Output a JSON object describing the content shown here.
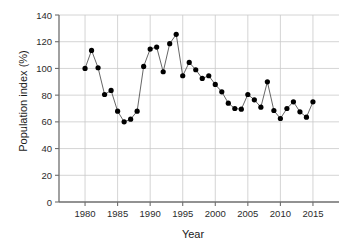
{
  "chart_data": {
    "type": "line",
    "title": "",
    "subtitle": "",
    "xlabel": "Year",
    "ylabel": "Population index (%)",
    "xlim": [
      1976,
      2019
    ],
    "ylim": [
      0,
      140
    ],
    "xticks": [
      1980,
      1985,
      1990,
      1995,
      2000,
      2005,
      2010,
      2015
    ],
    "yticks": [
      0,
      20,
      40,
      60,
      80,
      100,
      120,
      140
    ],
    "grid": true,
    "legend": null,
    "marker": "filled-circle",
    "marker_color": "#000000",
    "line_color": "#555555",
    "x": [
      1980,
      1981,
      1982,
      1983,
      1984,
      1985,
      1986,
      1987,
      1988,
      1989,
      1990,
      1991,
      1992,
      1993,
      1994,
      1995,
      1996,
      1997,
      1998,
      1999,
      2000,
      2001,
      2002,
      2003,
      2004,
      2005,
      2006,
      2007,
      2008,
      2009,
      2010,
      2011,
      2012,
      2013,
      2014,
      2015
    ],
    "values": [
      100,
      113.5,
      100.5,
      80.5,
      83.5,
      68,
      60,
      62,
      68,
      101.5,
      114.5,
      116,
      97.5,
      118.5,
      125.5,
      94.5,
      104.5,
      99,
      92.5,
      94.5,
      88,
      82.5,
      74,
      70,
      69.5,
      80.5,
      76.5,
      71,
      90,
      68.5,
      62.5,
      70,
      75,
      67.5,
      63.5,
      75
    ],
    "series": [
      {
        "name": "Population index",
        "values": [
          100,
          113.5,
          100.5,
          80.5,
          83.5,
          68,
          60,
          62,
          68,
          101.5,
          114.5,
          116,
          97.5,
          118.5,
          125.5,
          94.5,
          104.5,
          99,
          92.5,
          94.5,
          88,
          82.5,
          74,
          70,
          69.5,
          80.5,
          76.5,
          71,
          90,
          68.5,
          62.5,
          70,
          75,
          67.5,
          63.5,
          75
        ]
      }
    ]
  },
  "axes": {
    "y_title": "Population index (%)",
    "x_title": "Year"
  }
}
